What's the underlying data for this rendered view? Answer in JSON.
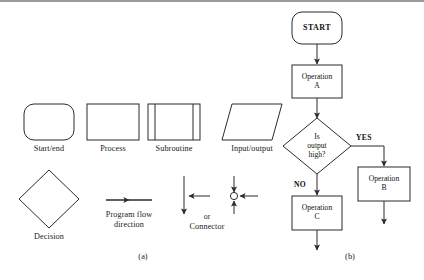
{
  "figure": {
    "panel_a_caption": "(a)",
    "panel_b_caption": "(b)",
    "stroke_color": "#2b2b2b",
    "rule_color": "#9a9a9a",
    "background": "#ffffff"
  },
  "legend": {
    "symbols": [
      {
        "name": "start-end",
        "label": "Start/end",
        "shape": "rounded-rectangle"
      },
      {
        "name": "process",
        "label": "Process",
        "shape": "rectangle"
      },
      {
        "name": "subroutine",
        "label": "Subroutine",
        "shape": "double-sided-rectangle"
      },
      {
        "name": "input-output",
        "label": "Input/output",
        "shape": "parallelogram"
      },
      {
        "name": "decision",
        "label": "Decision",
        "shape": "diamond"
      },
      {
        "name": "flow-direction",
        "label": "Program flow\ndirection",
        "shape": "arrow"
      },
      {
        "name": "connector",
        "label": "Connector",
        "shape": "junction",
        "alt_text": "or"
      }
    ]
  },
  "flowchart": {
    "nodes": [
      {
        "id": "start",
        "label": "START",
        "shape": "rounded-rectangle"
      },
      {
        "id": "operation-a",
        "label": "Operation\nA",
        "shape": "rectangle"
      },
      {
        "id": "decision",
        "label": "Is\noutput\nhigh?",
        "shape": "diamond"
      },
      {
        "id": "operation-b",
        "label": "Operation\nB",
        "shape": "rectangle"
      },
      {
        "id": "operation-c",
        "label": "Operation\nC",
        "shape": "rectangle"
      }
    ],
    "branches": [
      {
        "id": "yes",
        "label": "YES",
        "from": "decision",
        "to": "operation-b"
      },
      {
        "id": "no",
        "label": "NO",
        "from": "decision",
        "to": "operation-c"
      }
    ]
  }
}
